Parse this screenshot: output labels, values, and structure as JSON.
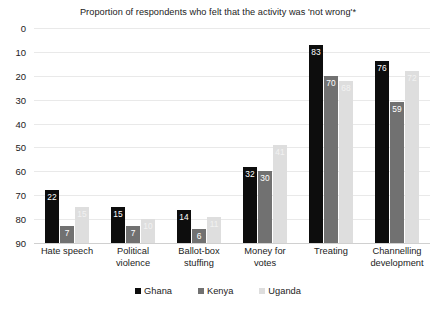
{
  "chart_data": {
    "type": "bar",
    "title": "Proportion of respondents who felt that the activity was 'not wrong'*",
    "xlabel": "",
    "ylabel": "",
    "ylim": [
      0,
      90
    ],
    "ytick_step": 10,
    "yticks": [
      "90",
      "80",
      "70",
      "60",
      "50",
      "40",
      "30",
      "20",
      "10",
      "0"
    ],
    "grid": true,
    "legend_position": "bottom-center",
    "categories": [
      "Hate speech",
      "Political violence",
      "Ballot-box stuffing",
      "Money for votes",
      "Treating",
      "Channelling development"
    ],
    "series": [
      {
        "name": "Ghana",
        "color": "#0d0d0d",
        "values": [
          22,
          15,
          14,
          32,
          83,
          76
        ],
        "labels": [
          "22",
          "15",
          "14",
          "32",
          "83",
          "76"
        ]
      },
      {
        "name": "Kenya",
        "color": "#717171",
        "values": [
          7,
          7,
          6,
          30,
          70,
          59
        ],
        "labels": [
          "7",
          "7",
          "6",
          "30",
          "70",
          "59"
        ]
      },
      {
        "name": "Uganda",
        "color": "#dedede",
        "values": [
          15,
          10,
          11,
          41,
          68,
          72
        ],
        "labels": [
          "15",
          "10",
          "11",
          "41",
          "68",
          "72"
        ]
      }
    ]
  }
}
